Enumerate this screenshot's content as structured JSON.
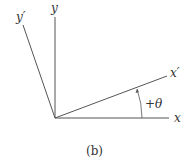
{
  "diagram": {
    "axes": {
      "x": {
        "label": "x"
      },
      "y": {
        "label": "y"
      },
      "x_prime": {
        "label": "x′"
      },
      "y_prime": {
        "label": "y′"
      }
    },
    "angle": {
      "label": "+θ"
    },
    "caption": "(b)",
    "colors": {
      "line": "#555555",
      "text": "#333333"
    }
  }
}
